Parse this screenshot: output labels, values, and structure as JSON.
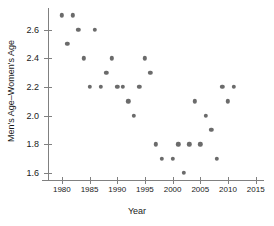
{
  "chart_data": {
    "type": "scatter",
    "title": "",
    "xlabel": "Year",
    "ylabel": "Men's Age–Women's Age",
    "xlim": [
      1977.5,
      2016.5
    ],
    "ylim": [
      1.55,
      2.75
    ],
    "grid": false,
    "legend": null,
    "xticks": [
      1980,
      1985,
      1990,
      1995,
      2000,
      2005,
      2010,
      2015
    ],
    "xtick_labels": [
      "1980",
      "1985",
      "1990",
      "1995",
      "2000",
      "2005",
      "2010",
      "2015"
    ],
    "yticks": [
      1.6,
      1.8,
      2.0,
      2.2,
      2.4,
      2.6
    ],
    "ytick_labels": [
      "1.6",
      "1.8",
      "2.0",
      "2.2",
      "2.4",
      "2.6"
    ],
    "marker_color": "#6b6b6b",
    "axis_color": "#808080",
    "text_color": "#1a1a1a",
    "background_color": "#ffffff",
    "x": [
      1980,
      1981,
      1982,
      1983,
      1984,
      1985,
      1986,
      1987,
      1988,
      1989,
      1990,
      1991,
      1992,
      1993,
      1994,
      1995,
      1996,
      1997,
      1998,
      2000,
      2001,
      2002,
      2003,
      2004,
      2005,
      2006,
      2007,
      2008,
      2009,
      2010,
      2011
    ],
    "y": [
      2.7,
      2.5,
      2.7,
      2.6,
      2.4,
      2.2,
      2.6,
      2.2,
      2.3,
      2.4,
      2.2,
      2.2,
      2.1,
      2.0,
      2.2,
      2.4,
      2.3,
      1.8,
      1.7,
      1.7,
      1.8,
      1.6,
      1.8,
      2.1,
      1.8,
      2.0,
      1.9,
      1.7,
      2.2,
      2.1,
      2.2
    ],
    "points": [
      {
        "x": 1980,
        "y": 2.7
      },
      {
        "x": 1981,
        "y": 2.5
      },
      {
        "x": 1982,
        "y": 2.7
      },
      {
        "x": 1983,
        "y": 2.6
      },
      {
        "x": 1984,
        "y": 2.4
      },
      {
        "x": 1985,
        "y": 2.2
      },
      {
        "x": 1986,
        "y": 2.6
      },
      {
        "x": 1987,
        "y": 2.2
      },
      {
        "x": 1988,
        "y": 2.3
      },
      {
        "x": 1989,
        "y": 2.4
      },
      {
        "x": 1990,
        "y": 2.2
      },
      {
        "x": 1991,
        "y": 2.2
      },
      {
        "x": 1992,
        "y": 2.1
      },
      {
        "x": 1993,
        "y": 2.0
      },
      {
        "x": 1994,
        "y": 2.2
      },
      {
        "x": 1995,
        "y": 2.4
      },
      {
        "x": 1996,
        "y": 2.3
      },
      {
        "x": 1997,
        "y": 1.8
      },
      {
        "x": 1998,
        "y": 1.7
      },
      {
        "x": 2000,
        "y": 1.7
      },
      {
        "x": 2001,
        "y": 1.8
      },
      {
        "x": 2002,
        "y": 1.6
      },
      {
        "x": 2003,
        "y": 1.8
      },
      {
        "x": 2004,
        "y": 2.1
      },
      {
        "x": 2005,
        "y": 1.8
      },
      {
        "x": 2006,
        "y": 2.0
      },
      {
        "x": 2007,
        "y": 1.9
      },
      {
        "x": 2008,
        "y": 1.7
      },
      {
        "x": 2009,
        "y": 2.2
      },
      {
        "x": 2010,
        "y": 2.1
      },
      {
        "x": 2011,
        "y": 2.2
      }
    ]
  }
}
